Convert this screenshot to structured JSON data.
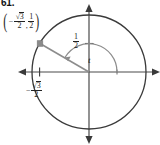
{
  "figure": {
    "problem_number": "61.",
    "type": "unit-circle-diagram",
    "colors": {
      "circle_stroke": "#3a3a3a",
      "axis_stroke": "#4a4a4a",
      "radius_stroke": "#8c8c8c",
      "arc_stroke": "#8c8c8c",
      "point_marker": "#8a8a8a",
      "text": "#1f1f1f",
      "background": "#ffffff"
    },
    "geometry": {
      "center_x": 89,
      "center_y": 72,
      "radius": 57,
      "terminal_point_x": 40,
      "terminal_point_y": 43,
      "angle_degrees": 150
    },
    "coordinate_label": {
      "open_paren": "(",
      "x_sign": "−",
      "x_numerator_radical": "√",
      "x_numerator_radicand": "3",
      "x_denominator": "2",
      "comma": ",",
      "y_numerator": "1",
      "y_denominator": "2",
      "close_paren": ")"
    },
    "y_axis_label": {
      "numerator": "1",
      "denominator": "2"
    },
    "x_axis_label": {
      "sign": "−",
      "numerator_radical": "√",
      "numerator_radicand": "3",
      "denominator": "2"
    },
    "angle_label": "t"
  }
}
